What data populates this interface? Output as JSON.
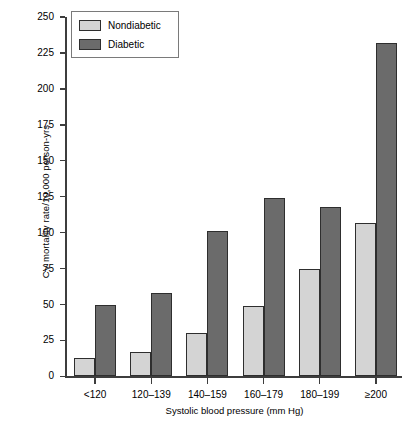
{
  "chart_data": {
    "type": "bar",
    "title": "",
    "xlabel": "Systolic blood pressure (mm Hg)",
    "ylabel": "CV mortality rate/10,000 person-yrs",
    "categories": [
      "<120",
      "120–139",
      "140–159",
      "160–179",
      "180–199",
      "≥200"
    ],
    "series": [
      {
        "name": "Nondiabetic",
        "color": "#d4d4d4",
        "values": [
          13,
          17,
          30,
          49,
          75,
          107
        ]
      },
      {
        "name": "Diabetic",
        "color": "#6b6b6b",
        "values": [
          50,
          58,
          101,
          124,
          118,
          232
        ]
      }
    ],
    "ylim": [
      0,
      250
    ],
    "yticks": [
      0,
      25,
      50,
      75,
      100,
      125,
      150,
      175,
      200,
      225,
      250
    ],
    "ytick_labels": [
      "0",
      "25",
      "50",
      "75",
      "100",
      "125",
      "150",
      "175",
      "200",
      "225",
      "250"
    ],
    "grid": false,
    "legend_position": "top-left",
    "legend_entries": [
      "Nondiabetic",
      "Diabetic"
    ]
  },
  "legend": {
    "entries": [
      {
        "label": "Nondiabetic"
      },
      {
        "label": "Diabetic"
      }
    ]
  },
  "axes": {
    "y_title": "CV mortality rate/10,000 person-yrs",
    "x_title": "Systolic blood pressure (mm Hg)"
  }
}
